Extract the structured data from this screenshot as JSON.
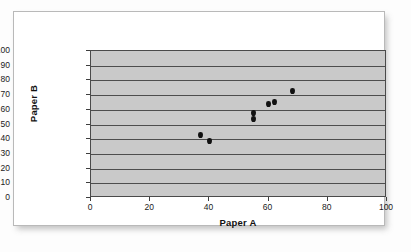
{
  "chart_data": {
    "type": "scatter",
    "title": "",
    "xlabel": "Paper A",
    "ylabel": "Paper B",
    "xlim": [
      0,
      100
    ],
    "ylim": [
      0,
      100
    ],
    "xticks": [
      0,
      20,
      40,
      60,
      80,
      100
    ],
    "yticks": [
      0,
      10,
      20,
      30,
      40,
      50,
      60,
      70,
      80,
      90,
      100
    ],
    "grid": "horizontal",
    "legend": "none",
    "plot_background": "#C9C9C9",
    "marker_color": "#111111",
    "series": [
      {
        "name": "Paper A vs Paper B",
        "points": [
          {
            "x": 37,
            "y": 43
          },
          {
            "x": 40,
            "y": 39
          },
          {
            "x": 55,
            "y": 58
          },
          {
            "x": 55,
            "y": 54
          },
          {
            "x": 60,
            "y": 64
          },
          {
            "x": 62,
            "y": 65
          },
          {
            "x": 68,
            "y": 73
          }
        ]
      }
    ]
  }
}
